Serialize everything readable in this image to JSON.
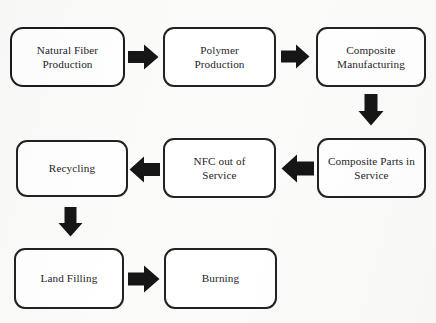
{
  "diagram": {
    "type": "flowchart",
    "background_color": "#fbfbfa",
    "node_fill_color": "#ffffff",
    "node_border_color": "#2b2b2b",
    "arrow_color": "#161616",
    "nodes": [
      {
        "id": "natural_fiber_production",
        "label": "Natural Fiber\nProduction",
        "row": 1,
        "column": 1
      },
      {
        "id": "polymer_production",
        "label": "Polymer\nProduction",
        "row": 1,
        "column": 2
      },
      {
        "id": "composite_manufacturing",
        "label": "Composite\nManufacturing",
        "row": 1,
        "column": 3
      },
      {
        "id": "recycling",
        "label": "Recycling",
        "row": 2,
        "column": 1
      },
      {
        "id": "nfc_out_of_service",
        "label": "NFC  out of\nService",
        "row": 2,
        "column": 2
      },
      {
        "id": "composite_parts_in_service",
        "label": "Composite Parts in\nService",
        "row": 2,
        "column": 3
      },
      {
        "id": "land_filling",
        "label": "Land Filling",
        "row": 3,
        "column": 1
      },
      {
        "id": "burning",
        "label": "Burning",
        "row": 3,
        "column": 2
      }
    ],
    "arrows": [
      {
        "id": "arrow-natural-fiber-to-polymer",
        "from": "natural_fiber_production",
        "to": "polymer_production",
        "direction": "right"
      },
      {
        "id": "arrow-polymer-to-composite-mfg",
        "from": "polymer_production",
        "to": "composite_manufacturing",
        "direction": "right"
      },
      {
        "id": "arrow-composite-mfg-to-parts",
        "from": "composite_manufacturing",
        "to": "composite_parts_in_service",
        "direction": "down"
      },
      {
        "id": "arrow-parts-to-nfc-out-of-service",
        "from": "composite_parts_in_service",
        "to": "nfc_out_of_service",
        "direction": "left"
      },
      {
        "id": "arrow-nfc-out-of-service-to-recycling",
        "from": "nfc_out_of_service",
        "to": "recycling",
        "direction": "left"
      },
      {
        "id": "arrow-recycling-to-land-filling",
        "from": "recycling",
        "to": "land_filling",
        "direction": "down"
      },
      {
        "id": "arrow-land-filling-to-burning",
        "from": "land_filling",
        "to": "burning",
        "direction": "right"
      }
    ]
  }
}
